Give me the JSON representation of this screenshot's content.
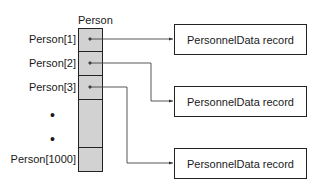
{
  "array": {
    "title": "Person",
    "labels": [
      "Person[1]",
      "Person[2]",
      "Person[3]",
      "Person[1000]"
    ],
    "ellipsis": [
      "•",
      "•"
    ]
  },
  "records": [
    {
      "label": "PersonnelData record"
    },
    {
      "label": "PersonnelData record"
    },
    {
      "label": "PersonnelData record"
    }
  ]
}
